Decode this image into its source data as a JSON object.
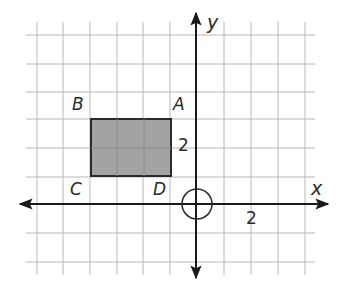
{
  "figure": {
    "type": "coordinate-grid",
    "grid": {
      "x_min": -6,
      "x_max": 4,
      "y_min": -2,
      "y_max": 6,
      "color": "#b8b8b8"
    },
    "axes": {
      "x_label": "x",
      "y_label": "y",
      "color": "#1a1a1a",
      "x_tick_label": "2",
      "y_tick_label": "2"
    },
    "origin_marker": {
      "shape": "circle",
      "radius_units": 0.55
    },
    "rectangle": {
      "vertices": {
        "A": {
          "label": "A",
          "x": -1,
          "y": 3
        },
        "B": {
          "label": "B",
          "x": -4,
          "y": 3
        },
        "C": {
          "label": "C",
          "x": -4,
          "y": 1
        },
        "D": {
          "label": "D",
          "x": -1,
          "y": 1
        }
      },
      "fill": "#a3a3a3",
      "stroke": "#2a2a2a"
    }
  }
}
